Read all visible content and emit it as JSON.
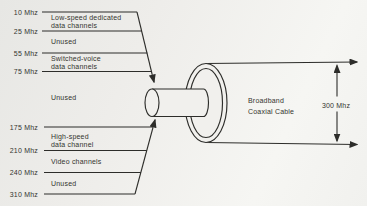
{
  "colors": {
    "background": "#efeeec",
    "ink": "#2d2d2a",
    "text": "#34342f"
  },
  "frequency_markers": [
    {
      "label": "10 Mhz"
    },
    {
      "label": "25 Mhz"
    },
    {
      "label": "55 Mhz"
    },
    {
      "label": "75 Mhz"
    },
    {
      "label": "175 Mhz"
    },
    {
      "label": "210 Mhz"
    },
    {
      "label": "240 Mhz"
    },
    {
      "label": "310 Mhz"
    }
  ],
  "bands": [
    {
      "lines": [
        "Low-speed dedicated",
        "data channels"
      ]
    },
    {
      "lines": [
        "Unused"
      ]
    },
    {
      "lines": [
        "Switched-voice",
        "data channels"
      ]
    },
    {
      "lines": [
        "Unused"
      ]
    },
    {
      "lines": [
        "High-speed",
        "data channel"
      ]
    },
    {
      "lines": [
        "Video channels"
      ]
    },
    {
      "lines": [
        "Unused"
      ]
    }
  ],
  "cable": {
    "label_lines": [
      "Broadband",
      "Coaxial Cable"
    ],
    "bandwidth": "300 Mhz"
  }
}
